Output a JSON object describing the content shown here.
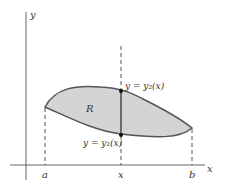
{
  "diagram": {
    "axes": {
      "x_label": "x",
      "y_label": "y"
    },
    "region": {
      "label": "R",
      "fill_color": "#d4d4d4",
      "stroke_color": "#555555"
    },
    "ticks": {
      "a": "a",
      "x": "x",
      "b": "b"
    },
    "curves": {
      "upper": "y = y₂(x)",
      "lower": "y = y₁(x)"
    }
  }
}
